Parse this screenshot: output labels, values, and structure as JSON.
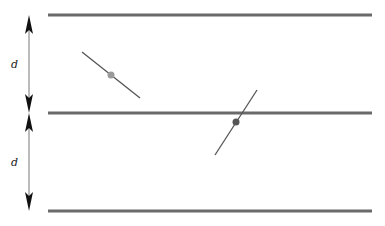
{
  "diagram": {
    "colors": {
      "line": "#6a6a6a",
      "arrow": "#111111",
      "needle": "#555555",
      "center_light": "#9a9a9a",
      "center_dark": "#555555"
    },
    "parallel_lines": [
      {
        "y": 15,
        "x1": 48,
        "x2": 372
      },
      {
        "y": 113,
        "x1": 48,
        "x2": 372
      },
      {
        "y": 211,
        "x1": 48,
        "x2": 372
      }
    ],
    "spacing_labels": [
      {
        "text": "d",
        "x": 11,
        "y": 68
      },
      {
        "text": "d",
        "x": 11,
        "y": 166
      }
    ],
    "needles": [
      {
        "x1": 82,
        "y1": 52,
        "x2": 140,
        "y2": 98,
        "cx": 111,
        "cy": 75,
        "center_color": "#9a9a9a",
        "crosses_line": false
      },
      {
        "x1": 215,
        "y1": 155,
        "x2": 257,
        "y2": 90,
        "cx": 236,
        "cy": 122,
        "center_color": "#555555",
        "crosses_line": true
      }
    ]
  }
}
